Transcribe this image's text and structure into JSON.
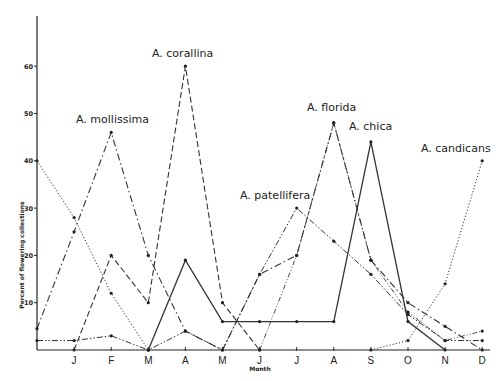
{
  "chart_data": {
    "type": "line",
    "title": "",
    "xlabel": "Month",
    "ylabel": "Percent of flowering collections",
    "x": [
      "",
      "J",
      "F",
      "M",
      "A",
      "M",
      "J",
      "J",
      "A",
      "S",
      "O",
      "N",
      "D"
    ],
    "x_tick_labels": [
      "J",
      "F",
      "M",
      "A",
      "M",
      "J",
      "J",
      "A",
      "S",
      "O",
      "N",
      "D"
    ],
    "y_ticks": [
      10,
      20,
      30,
      40,
      50,
      60
    ],
    "ylim": [
      0,
      70
    ],
    "grid": false,
    "legend": "inline labels near series peaks",
    "series": [
      {
        "name": "A. mollissima",
        "style": "dashdot",
        "values": [
          4.5,
          25,
          46,
          20,
          4,
          0,
          16,
          20,
          48,
          19,
          10,
          5,
          0
        ]
      },
      {
        "name": "A. corallina",
        "style": "dashed",
        "values": [
          null,
          0,
          20,
          10,
          60,
          10,
          0,
          null,
          null,
          null,
          null,
          null,
          null
        ]
      },
      {
        "name": "A. chica",
        "style": "solid",
        "values": [
          null,
          null,
          null,
          0,
          19,
          6,
          6,
          6,
          6,
          44,
          6,
          0,
          null
        ]
      },
      {
        "name": "A. patellifera",
        "style": "dashdotdot",
        "values": [
          2,
          2,
          3,
          0,
          4,
          0,
          16,
          30,
          23,
          16,
          7.5,
          2,
          2
        ]
      },
      {
        "name": "A. florida",
        "style": "dashdotdot-light",
        "values": [
          null,
          null,
          null,
          null,
          null,
          null,
          0,
          20,
          48,
          19,
          8,
          2,
          4
        ]
      },
      {
        "name": "A. candicans",
        "style": "dotted",
        "values": [
          40,
          28,
          12,
          0,
          null,
          null,
          null,
          null,
          null,
          0,
          2,
          14,
          40
        ]
      }
    ]
  },
  "labels": {
    "ylabel": "Percent of flowering collections",
    "xlabel": "Month",
    "yticks": [
      "10",
      "20",
      "30",
      "40",
      "50",
      "60"
    ],
    "xticks": [
      "J",
      "F",
      "M",
      "A",
      "M",
      "J",
      "J",
      "A",
      "S",
      "O",
      "N",
      "D"
    ],
    "series": {
      "mollissima": "A. mollissima",
      "corallina": "A. corallina",
      "florida": "A. florida",
      "chica": "A. chica",
      "patellifera": "A. patellifera",
      "candicans": "A. candicans"
    }
  }
}
